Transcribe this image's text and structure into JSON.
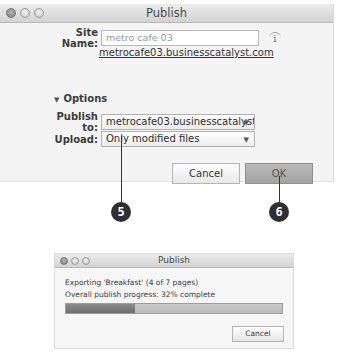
{
  "publish_dialog": {
    "title": "Publish",
    "site_name_label": "Site Name:",
    "site_name_value": "metro cafe 03",
    "info_icon": "i",
    "site_url": "metrocafe03.businesscatalyst.com",
    "options_label": "Options",
    "options_triangle": "▼",
    "publish_to_label": "Publish to:",
    "publish_to_value": "metrocafe03.businesscatalyst.c...",
    "upload_label": "Upload:",
    "upload_value": "Only modified files",
    "caret": "▼",
    "cancel_label": "Cancel",
    "ok_label": "OK"
  },
  "callouts": [
    {
      "number": "5"
    },
    {
      "number": "6"
    }
  ],
  "progress_dialog": {
    "title": "Publish",
    "status_line": "Exporting 'Breakfast' (4 of 7 pages)",
    "progress_line": "Overall publish progress: 32% complete",
    "progress_percent": 32,
    "cancel_label": "Cancel"
  }
}
